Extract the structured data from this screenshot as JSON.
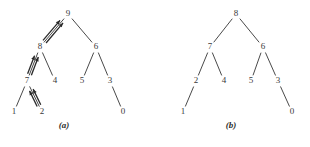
{
  "figure": {
    "background_color": "#ffffff",
    "line_color": "#4a4a4a",
    "arrow_color": "#2a2a2a",
    "label_color": "#3a3a3a"
  },
  "panels": [
    {
      "id": "a",
      "caption": "(a)",
      "caption_pos": {
        "x": 64,
        "y": 120
      },
      "nodes": [
        {
          "key": "9",
          "label": "9",
          "x": 68,
          "y": 14
        },
        {
          "key": "8",
          "label": "8",
          "x": 40,
          "y": 47
        },
        {
          "key": "6",
          "label": "6",
          "x": 96,
          "y": 47
        },
        {
          "key": "7",
          "label": "7",
          "x": 27,
          "y": 81
        },
        {
          "key": "4",
          "label": "4",
          "x": 55,
          "y": 81
        },
        {
          "key": "5",
          "label": "5",
          "x": 82,
          "y": 81
        },
        {
          "key": "3",
          "label": "3",
          "x": 110,
          "y": 81
        },
        {
          "key": "1",
          "label": "1",
          "x": 14,
          "y": 112
        },
        {
          "key": "2",
          "label": "2",
          "x": 42,
          "y": 112
        },
        {
          "key": "0",
          "label": "0",
          "x": 123,
          "y": 112
        }
      ],
      "edges": [
        {
          "from": "9",
          "to": "8"
        },
        {
          "from": "9",
          "to": "6"
        },
        {
          "from": "8",
          "to": "7"
        },
        {
          "from": "8",
          "to": "4"
        },
        {
          "from": "6",
          "to": "5"
        },
        {
          "from": "6",
          "to": "3"
        },
        {
          "from": "7",
          "to": "1"
        },
        {
          "from": "7",
          "to": "2"
        },
        {
          "from": "3",
          "to": "0"
        }
      ],
      "arrows": [
        {
          "from": "8",
          "to": "9",
          "direction": "up-right",
          "count": 2,
          "offset": 4
        },
        {
          "from": "7",
          "to": "8",
          "direction": "up-right",
          "count": 2,
          "offset": 4
        },
        {
          "from": "2",
          "to": "7",
          "direction": "up-left",
          "count": 2,
          "offset": 4
        }
      ]
    },
    {
      "id": "b",
      "caption": "(b)",
      "caption_pos": {
        "x": 76,
        "y": 120
      },
      "nodes": [
        {
          "key": "8",
          "label": "8",
          "x": 81,
          "y": 14
        },
        {
          "key": "7",
          "label": "7",
          "x": 55,
          "y": 47
        },
        {
          "key": "6",
          "label": "6",
          "x": 108,
          "y": 47
        },
        {
          "key": "2",
          "label": "2",
          "x": 41,
          "y": 81
        },
        {
          "key": "4",
          "label": "4",
          "x": 69,
          "y": 81
        },
        {
          "key": "5",
          "label": "5",
          "x": 96,
          "y": 81
        },
        {
          "key": "3",
          "label": "3",
          "x": 123,
          "y": 81
        },
        {
          "key": "1",
          "label": "1",
          "x": 28,
          "y": 112
        },
        {
          "key": "0",
          "label": "0",
          "x": 137,
          "y": 112
        }
      ],
      "edges": [
        {
          "from": "8",
          "to": "7"
        },
        {
          "from": "8",
          "to": "6"
        },
        {
          "from": "7",
          "to": "2"
        },
        {
          "from": "7",
          "to": "4"
        },
        {
          "from": "6",
          "to": "5"
        },
        {
          "from": "6",
          "to": "3"
        },
        {
          "from": "2",
          "to": "1"
        },
        {
          "from": "3",
          "to": "0"
        }
      ],
      "arrows": []
    }
  ]
}
